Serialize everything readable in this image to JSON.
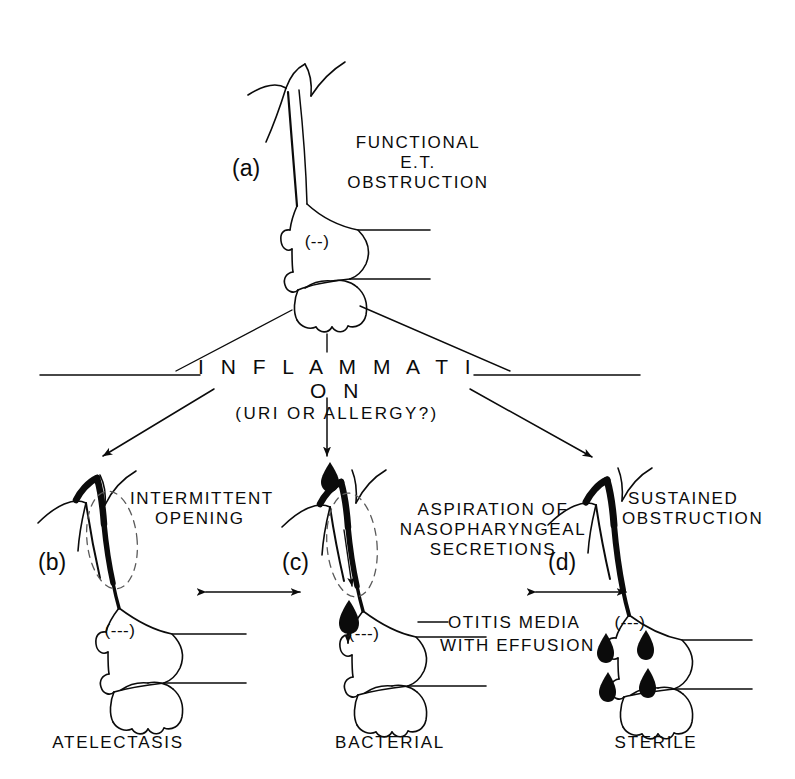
{
  "figure": {
    "kind": "medical-flow-diagram",
    "background_color": "#ffffff",
    "ink_color": "#0b0b0b"
  },
  "nodes": {
    "a": {
      "tag": "(a)",
      "title_lines": [
        "FUNCTIONAL",
        "E.T.",
        "OBSTRUCTION"
      ],
      "pressure_marker": "(--)"
    },
    "inflammation": {
      "title": "I N F L A M M A T I O N",
      "subtitle": "(URI OR ALLERGY?)"
    },
    "b": {
      "tag": "(b)",
      "title_lines": [
        "INTERMITTENT",
        "OPENING"
      ],
      "pressure_marker": "(---)",
      "outcome": "ATELECTASIS"
    },
    "c": {
      "tag": "(c)",
      "title_lines": [
        "ASPIRATION OF",
        "NASOPHARYNGEAL",
        "SECRETIONS"
      ],
      "pressure_marker": "(---)",
      "outcome": "BACTERIAL"
    },
    "d": {
      "tag": "(d)",
      "title_lines": [
        "SUSTAINED",
        "OBSTRUCTION"
      ],
      "pressure_marker": "(---)",
      "outcome": "STERILE"
    },
    "effusion": {
      "title_lines": [
        "OTITIS MEDIA",
        "WITH EFFUSION"
      ]
    }
  },
  "edges": [
    {
      "from": "a",
      "to": "inflammation",
      "style": "line"
    },
    {
      "from": "inflammation",
      "to": "b",
      "style": "arrow"
    },
    {
      "from": "inflammation",
      "to": "c",
      "style": "arrow"
    },
    {
      "from": "inflammation",
      "to": "d",
      "style": "arrow"
    },
    {
      "from": "b",
      "to": "c",
      "style": "double-arrow"
    },
    {
      "from": "c",
      "to": "d",
      "style": "double-arrow"
    }
  ]
}
